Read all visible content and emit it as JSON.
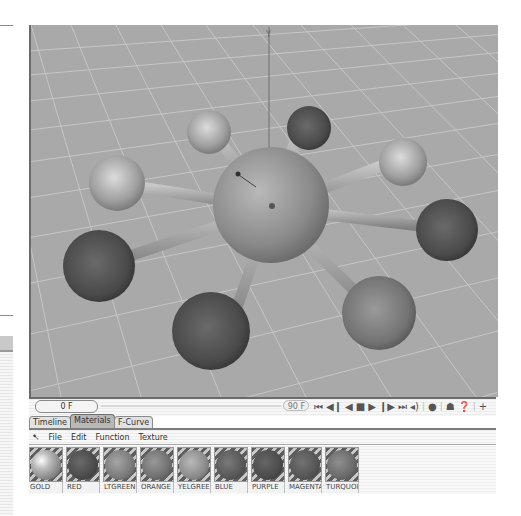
{
  "timeline": {
    "current_frame": "0 F",
    "end_frame": "90 F"
  },
  "playback_controls": [
    {
      "name": "go-to-start-icon",
      "glyph": "⏮"
    },
    {
      "name": "step-back-icon",
      "glyph": "◀❙"
    },
    {
      "name": "play-backward-icon",
      "glyph": "◀"
    },
    {
      "name": "stop-icon",
      "glyph": "■"
    },
    {
      "name": "play-forward-icon",
      "glyph": "▶"
    },
    {
      "name": "step-forward-icon",
      "glyph": "❙▶"
    },
    {
      "name": "go-to-end-icon",
      "glyph": "⏭"
    },
    {
      "name": "sound-icon",
      "glyph": "🔈"
    },
    {
      "name": "record-icon",
      "glyph": "●"
    },
    {
      "name": "render-helmet-icon",
      "glyph": "☗"
    },
    {
      "name": "help-icon",
      "glyph": "?"
    },
    {
      "name": "add-icon",
      "glyph": "+"
    }
  ],
  "tabs": [
    {
      "label": "Timeline",
      "active": false
    },
    {
      "label": "Materials",
      "active": true
    },
    {
      "label": "F-Curve",
      "active": false
    }
  ],
  "menu": {
    "icon": "arrow-pointer-icon",
    "items": [
      "File",
      "Edit",
      "Function",
      "Texture"
    ]
  },
  "materials": [
    {
      "label": "GOLD",
      "color": "#a8a8a8",
      "highlight": "#ffffff"
    },
    {
      "label": "RED",
      "color": "#4a4a4a",
      "highlight": "#6a6a6a"
    },
    {
      "label": "LTGREEN",
      "color": "#7a7a7a",
      "highlight": "#a5a5a5"
    },
    {
      "label": "ORANGE",
      "color": "#6f6f6f",
      "highlight": "#999999"
    },
    {
      "label": "YELGREE",
      "color": "#8a8a8a",
      "highlight": "#b9b9b9"
    },
    {
      "label": "BLUE",
      "color": "#575757",
      "highlight": "#7a7a7a"
    },
    {
      "label": "PURPLE",
      "color": "#4b4b4b",
      "highlight": "#656565"
    },
    {
      "label": "MAGENTA",
      "color": "#555555",
      "highlight": "#727272"
    },
    {
      "label": "TURQUOI",
      "color": "#6a6a6a",
      "highlight": "#8e8e8e"
    }
  ],
  "viewport": {
    "background": "#a9a9a9",
    "grid_color": "#c4c4c4",
    "axis_label": "Y"
  }
}
